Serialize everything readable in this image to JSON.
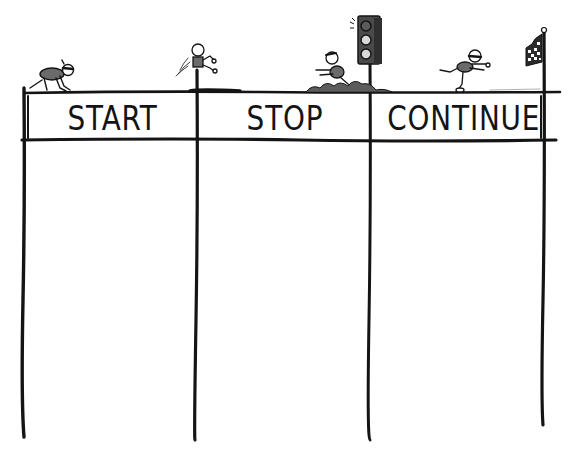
{
  "board": {
    "type": "start-stop-continue retrospective",
    "ink_color": "#141414",
    "figure_fill": "#6b6b6b",
    "background": "#ffffff",
    "columns": [
      {
        "id": "start",
        "label": "START",
        "figure": "runner-in-starting-crouch",
        "entries": []
      },
      {
        "id": "stop",
        "label": "STOP",
        "figure": "runner-skidding-before-traffic-light",
        "entries": []
      },
      {
        "id": "continue",
        "label": "CONTINUE",
        "figure": "runner-sprinting-to-checkered-flag",
        "entries": []
      }
    ],
    "decorations": {
      "col1_post": "figure-leaping-on-post",
      "col2_post": "traffic-light-red",
      "col3_post": "checkered-finish-flag"
    }
  }
}
